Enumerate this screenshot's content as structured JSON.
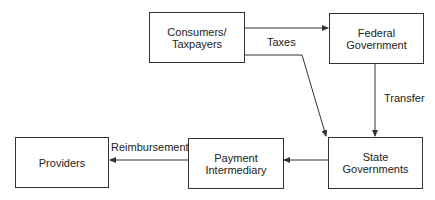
{
  "nodes": {
    "consumers": {
      "line1": "Consumers/",
      "line2": "Taxpayers"
    },
    "federal": {
      "line1": "Federal",
      "line2": "Government"
    },
    "state": {
      "line1": "State",
      "line2": "Governments"
    },
    "payment": {
      "line1": "Payment",
      "line2": "Intermediary"
    },
    "providers": {
      "line1": "Providers"
    }
  },
  "edges": {
    "taxes": "Taxes",
    "transfer": "Transfer",
    "reimbursement": "Reimbursement"
  },
  "colors": {
    "line": "#333333",
    "background": "#ffffff"
  }
}
